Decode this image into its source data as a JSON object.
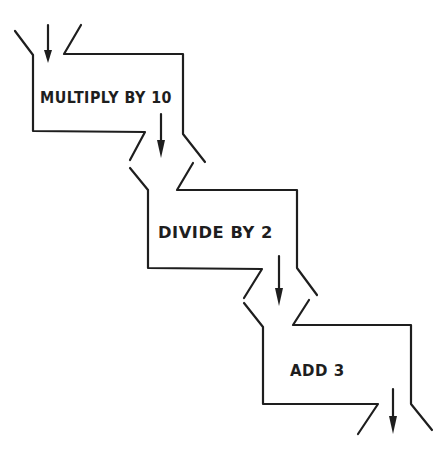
{
  "diagram": {
    "type": "flow-pipeline",
    "stroke_color": "#1e1e1e",
    "background": "#ffffff",
    "stages": [
      {
        "id": "stage-1",
        "label": "MULTIPLY BY 10"
      },
      {
        "id": "stage-2",
        "label": "DIVIDE BY 2"
      },
      {
        "id": "stage-3",
        "label": "ADD 3"
      }
    ],
    "flow": [
      {
        "from": "input",
        "to": "stage-1"
      },
      {
        "from": "stage-1",
        "to": "stage-2"
      },
      {
        "from": "stage-2",
        "to": "stage-3"
      },
      {
        "from": "stage-3",
        "to": "output"
      }
    ]
  }
}
